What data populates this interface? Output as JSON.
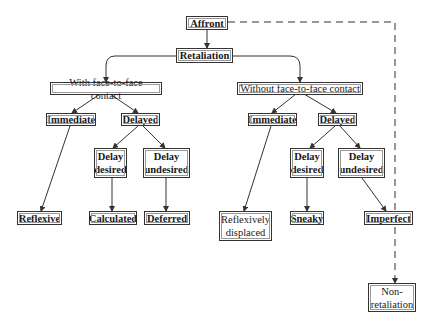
{
  "diagram": {
    "type": "tree",
    "colors": {
      "line": "#333333",
      "background": "#ffffff"
    },
    "nodes": {
      "affront": "Affront",
      "retaliation": "Retaliation",
      "with_contact": "With face-to-face contact",
      "without_contact": "Without face-to-face contact",
      "with_immediate": "Immediate",
      "with_delayed": "Delayed",
      "with_delay_desired": "Delay\ndesired",
      "with_delay_undesired": "Delay\nundesired",
      "reflexive": "Reflexive",
      "calculated": "Calculated",
      "deferred": "Deferred",
      "without_immediate": "Immediate",
      "without_delayed": "Delayed",
      "without_delay_desired": "Delay\ndesired",
      "without_delay_undesired": "Delay\nundesired",
      "reflexively_displaced": "Reflexively\ndisplaced",
      "sneaky": "Sneaky",
      "imperfect": "Imperfect",
      "non_retaliation": "Non-\nretaliation"
    },
    "edges": [
      {
        "from": "Affront",
        "to": "Retaliation",
        "style": "solid"
      },
      {
        "from": "Affront",
        "to": "Non-retaliation",
        "style": "dashed"
      },
      {
        "from": "Retaliation",
        "to": "With face-to-face contact",
        "style": "solid"
      },
      {
        "from": "Retaliation",
        "to": "Without face-to-face contact",
        "style": "solid"
      },
      {
        "from": "With face-to-face contact",
        "to": "Immediate",
        "style": "solid"
      },
      {
        "from": "With face-to-face contact",
        "to": "Delayed",
        "style": "solid"
      },
      {
        "from": "Immediate",
        "to": "Reflexive",
        "style": "solid"
      },
      {
        "from": "Delayed",
        "to": "Delay desired",
        "style": "solid"
      },
      {
        "from": "Delayed",
        "to": "Delay undesired",
        "style": "solid"
      },
      {
        "from": "Delay desired",
        "to": "Calculated",
        "style": "solid"
      },
      {
        "from": "Delay undesired",
        "to": "Deferred",
        "style": "solid"
      },
      {
        "from": "Without face-to-face contact",
        "to": "Immediate",
        "style": "solid"
      },
      {
        "from": "Without face-to-face contact",
        "to": "Delayed",
        "style": "solid"
      },
      {
        "from": "Immediate",
        "to": "Reflexively displaced",
        "style": "solid"
      },
      {
        "from": "Delayed",
        "to": "Delay desired",
        "style": "solid"
      },
      {
        "from": "Delayed",
        "to": "Delay undesired",
        "style": "solid"
      },
      {
        "from": "Delay desired",
        "to": "Sneaky",
        "style": "solid"
      },
      {
        "from": "Delay undesired",
        "to": "Imperfect",
        "style": "solid"
      }
    ]
  }
}
